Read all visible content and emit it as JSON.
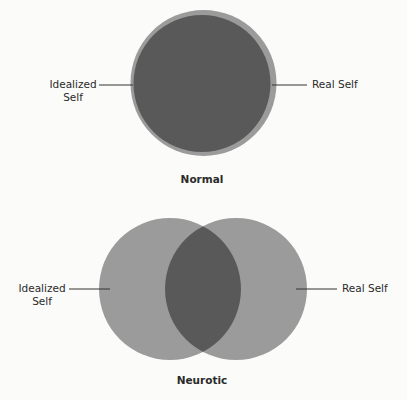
{
  "colors": {
    "background": "#fbfbf9",
    "circle_light": "#9b9b9b",
    "circle_dark": "#595959",
    "leader_line": "#333333"
  },
  "normal": {
    "caption": "Normal",
    "left_label": [
      "Idealized",
      "Self"
    ],
    "right_label": "Real Self"
  },
  "neurotic": {
    "caption": "Neurotic",
    "left_label": [
      "Idealized",
      "Self"
    ],
    "right_label": "Real Self"
  }
}
